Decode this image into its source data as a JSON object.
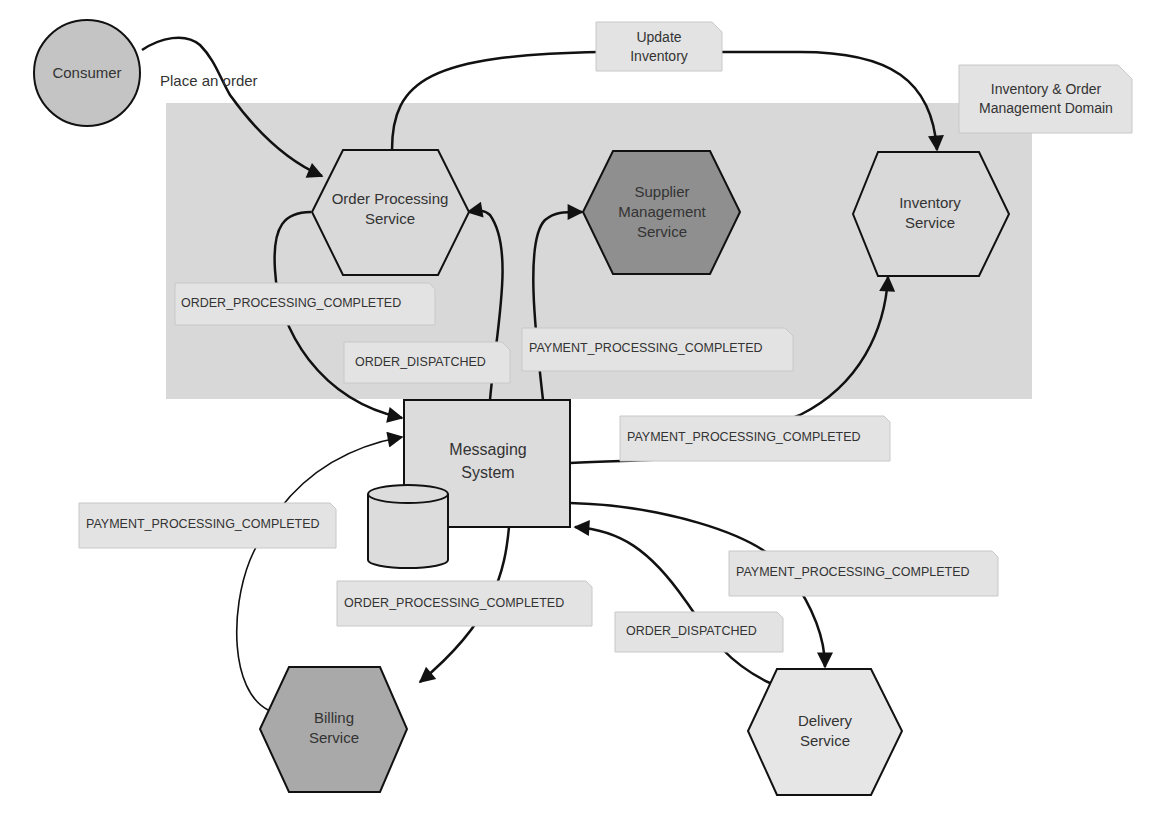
{
  "diagram": {
    "domain_box": {
      "label_line1": "Inventory & Order",
      "label_line2": "Management Domain",
      "fill": "#d8d8d8"
    },
    "nodes": {
      "consumer": {
        "label": "Consumer",
        "shape": "circle",
        "fill": "#c4c4c4"
      },
      "order_processing": {
        "line1": "Order Processing",
        "line2": "Service",
        "shape": "hexagon",
        "fill": "#d9d9d9"
      },
      "supplier_management": {
        "line1": "Supplier",
        "line2": "Management",
        "line3": "Service",
        "shape": "hexagon",
        "fill": "#8f8f8f"
      },
      "inventory": {
        "line1": "Inventory",
        "line2": "Service",
        "shape": "hexagon",
        "fill": "#d9d9d9"
      },
      "messaging": {
        "line1": "Messaging",
        "line2": "System",
        "shape": "rectangle",
        "fill": "#dcdcdc"
      },
      "datastore": {
        "shape": "cylinder",
        "fill": "#dcdcdc"
      },
      "billing": {
        "line1": "Billing",
        "line2": "Service",
        "shape": "hexagon",
        "fill": "#a9a9a9"
      },
      "delivery": {
        "line1": "Delivery",
        "line2": "Service",
        "shape": "hexagon",
        "fill": "#e6e6e6"
      }
    },
    "edge_labels": {
      "place_order": "Place an order",
      "update_inventory_line1": "Update",
      "update_inventory_line2": "Inventory",
      "ops_to_msg": "ORDER_PROCESSING_COMPLETED",
      "msg_to_ops_dispatched": "ORDER_DISPATCHED",
      "msg_to_supplier": "PAYMENT_PROCESSING_COMPLETED",
      "msg_to_inventory": "PAYMENT_PROCESSING_COMPLETED",
      "billing_to_msg": "PAYMENT_PROCESSING_COMPLETED",
      "msg_to_billing": "ORDER_PROCESSING_COMPLETED",
      "msg_to_delivery": "PAYMENT_PROCESSING_COMPLETED",
      "delivery_to_msg": "ORDER_DISPATCHED"
    }
  }
}
